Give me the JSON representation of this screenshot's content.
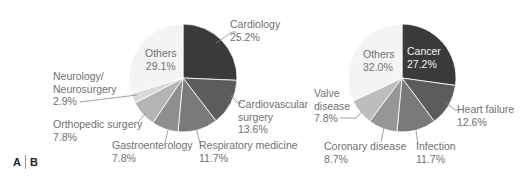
{
  "chart_data": [
    {
      "type": "pie",
      "panel": "A",
      "title": "",
      "categories": [
        "Cardiology",
        "Cardiovascular surgery",
        "Respiratory medicine",
        "Gastroenterology",
        "Orthopedic surgery",
        "Neurology/ Neurosurgery",
        "Others"
      ],
      "values": [
        25.2,
        13.6,
        11.7,
        7.8,
        7.8,
        2.9,
        29.1
      ],
      "unit": "%",
      "colors": [
        "#3a3a3a",
        "#5c5c5c",
        "#7a7a7a",
        "#8e8e8e",
        "#b4b4b4",
        "#d9d9d9",
        "#f4f4f4"
      ]
    },
    {
      "type": "pie",
      "panel": "B",
      "title": "",
      "categories": [
        "Cancer",
        "Heart failure",
        "Infection",
        "Coronary disease",
        "Valve disease",
        "Others"
      ],
      "values": [
        27.2,
        12.6,
        11.7,
        8.7,
        7.8,
        32.0
      ],
      "unit": "%",
      "colors": [
        "#3a3a3a",
        "#5c5c5c",
        "#7a7a7a",
        "#969696",
        "#bdbdbd",
        "#f4f4f4"
      ]
    }
  ],
  "labels": {
    "a": {
      "cardiology": {
        "name": "Cardiology",
        "pct": "25.2%"
      },
      "cardiovascular": {
        "name1": "Cardiovascular",
        "name2": "surgery",
        "pct": "13.6%"
      },
      "respiratory": {
        "name": "Respiratory medicine",
        "pct": "11.7%"
      },
      "gastro": {
        "name": "Gastroenterology",
        "pct": "7.8%"
      },
      "ortho": {
        "name": "Orthopedic surgery",
        "pct": "7.8%"
      },
      "neuro": {
        "name1": "Neurology/",
        "name2": "Neurosurgery",
        "pct": "2.9%"
      },
      "others": {
        "name": "Others",
        "pct": "29.1%"
      }
    },
    "b": {
      "cancer": {
        "name": "Cancer",
        "pct": "27.2%"
      },
      "heart": {
        "name": "Heart failure",
        "pct": "12.6%"
      },
      "infection": {
        "name": "Infection",
        "pct": "11.7%"
      },
      "coronary": {
        "name": "Coronary disease",
        "pct": "8.7%"
      },
      "valve": {
        "name1": "Valve",
        "name2": "disease",
        "pct": "7.8%"
      },
      "others": {
        "name": "Others",
        "pct": "32.0%"
      }
    }
  },
  "panels": {
    "a": "A",
    "b": "B"
  }
}
